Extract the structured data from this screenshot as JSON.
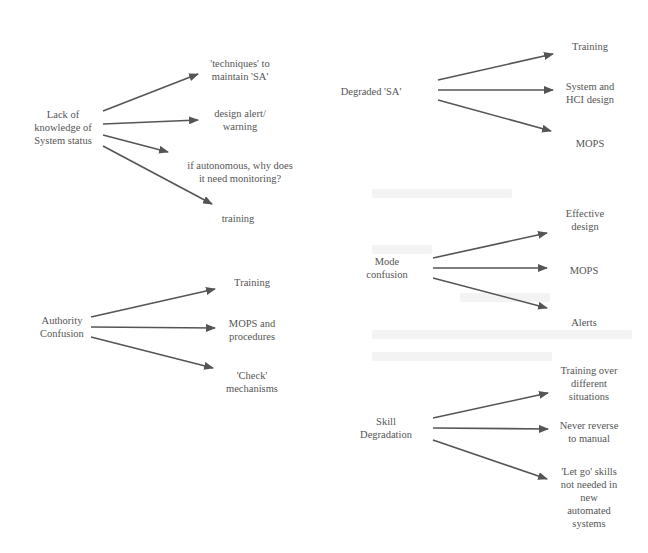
{
  "diagram": {
    "type": "cause-to-mitigation mind map",
    "arrow_color": "#555555",
    "text_color": "#555555",
    "groups": [
      {
        "id": "lack-of-knowledge",
        "source": {
          "label": "Lack of\nknowledge of\nSystem status",
          "x": 63,
          "y": 127
        },
        "targets": [
          {
            "label": "'techniques' to\nmaintain 'SA'",
            "x": 240,
            "y": 70
          },
          {
            "label": "design alert/\nwarning",
            "x": 240,
            "y": 120
          },
          {
            "label": "if autonomous, why does\nit need monitoring?",
            "x": 240,
            "y": 172
          },
          {
            "label": "training",
            "x": 238,
            "y": 218
          }
        ],
        "arrows": [
          {
            "x1": 103,
            "y1": 111,
            "x2": 198,
            "y2": 74
          },
          {
            "x1": 103,
            "y1": 124,
            "x2": 198,
            "y2": 120
          },
          {
            "x1": 103,
            "y1": 135,
            "x2": 168,
            "y2": 152
          },
          {
            "x1": 103,
            "y1": 146,
            "x2": 212,
            "y2": 204
          }
        ]
      },
      {
        "id": "degraded-sa",
        "source": {
          "label": "Degraded 'SA'",
          "x": 371,
          "y": 91
        },
        "targets": [
          {
            "label": "Training",
            "x": 590,
            "y": 46
          },
          {
            "label": "System and\nHCI design",
            "x": 590,
            "y": 93
          },
          {
            "label": "MOPS",
            "x": 590,
            "y": 143
          }
        ],
        "arrows": [
          {
            "x1": 438,
            "y1": 80,
            "x2": 553,
            "y2": 54
          },
          {
            "x1": 438,
            "y1": 90,
            "x2": 553,
            "y2": 90
          },
          {
            "x1": 438,
            "y1": 100,
            "x2": 551,
            "y2": 131
          }
        ]
      },
      {
        "id": "mode-confusion",
        "source": {
          "label": "Mode\nconfusion",
          "x": 387,
          "y": 268
        },
        "targets": [
          {
            "label": "Effective\ndesign",
            "x": 585,
            "y": 220
          },
          {
            "label": "MOPS",
            "x": 584,
            "y": 270
          },
          {
            "label": "Alerts",
            "x": 584,
            "y": 322
          }
        ],
        "arrows": [
          {
            "x1": 433,
            "y1": 258,
            "x2": 547,
            "y2": 233
          },
          {
            "x1": 433,
            "y1": 268,
            "x2": 547,
            "y2": 268
          },
          {
            "x1": 433,
            "y1": 278,
            "x2": 547,
            "y2": 308
          }
        ]
      },
      {
        "id": "authority-confusion",
        "source": {
          "label": "Authority\nConfusion",
          "x": 62,
          "y": 327
        },
        "targets": [
          {
            "label": "Training",
            "x": 252,
            "y": 282
          },
          {
            "label": "MOPS and\nprocedures",
            "x": 252,
            "y": 330
          },
          {
            "label": "'Check'\nmechanisms",
            "x": 252,
            "y": 382
          }
        ],
        "arrows": [
          {
            "x1": 91,
            "y1": 317,
            "x2": 215,
            "y2": 289
          },
          {
            "x1": 91,
            "y1": 327,
            "x2": 215,
            "y2": 328
          },
          {
            "x1": 91,
            "y1": 337,
            "x2": 213,
            "y2": 368
          }
        ]
      },
      {
        "id": "skill-degradation",
        "source": {
          "label": "Skill\nDegradation",
          "x": 386,
          "y": 428
        },
        "targets": [
          {
            "label": "Training over\ndifferent\nsituations",
            "x": 589,
            "y": 383
          },
          {
            "label": "Never reverse\nto manual",
            "x": 589,
            "y": 432
          },
          {
            "label": "'Let go' skills\nnot needed in\nnew\nautomated\nsystems",
            "x": 589,
            "y": 497
          }
        ],
        "arrows": [
          {
            "x1": 433,
            "y1": 418,
            "x2": 548,
            "y2": 393
          },
          {
            "x1": 433,
            "y1": 428,
            "x2": 548,
            "y2": 429
          },
          {
            "x1": 433,
            "y1": 440,
            "x2": 547,
            "y2": 479
          }
        ]
      }
    ]
  }
}
